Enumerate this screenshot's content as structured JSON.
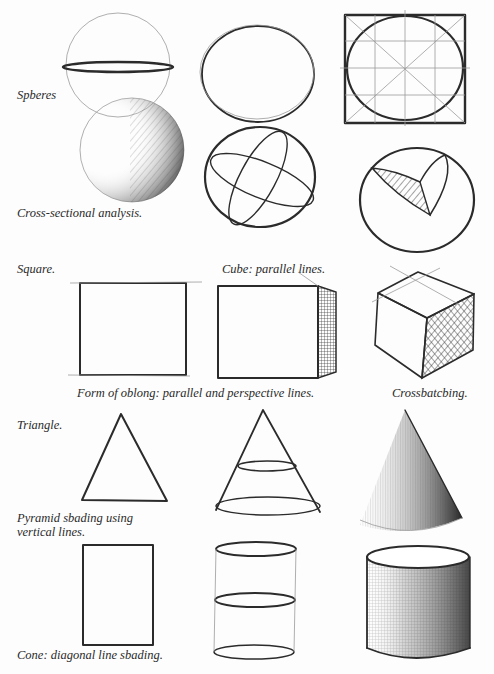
{
  "figure": {
    "ink_color": "#2b2b2b",
    "paper_color": "#fdfdfd"
  },
  "labels": {
    "spheres": "Spberes",
    "cross_section": "Cross-sectional analysis.",
    "square": "Square.",
    "cube": "Cube: parallel lines.",
    "oblong": "Form of oblong: parallel and perspective lines.",
    "crosshatching": "Crossbatcbing.",
    "triangle": "Triangle.",
    "pyramid_line1": "Pyramid sbading using",
    "pyramid_line2": "vertical lines.",
    "cone": "Cone: diagonal line sbading."
  },
  "sketches": [
    {
      "id": "sphere-equator",
      "row": 1,
      "col": 1
    },
    {
      "id": "circle-outline",
      "row": 1,
      "col": 2
    },
    {
      "id": "circle-in-square-grid",
      "row": 1,
      "col": 3
    },
    {
      "id": "sphere-shaded",
      "row": 2,
      "col": 1
    },
    {
      "id": "sphere-cross-sections",
      "row": 2,
      "col": 2
    },
    {
      "id": "sphere-cutaway",
      "row": 2,
      "col": 3
    },
    {
      "id": "square",
      "row": 3,
      "col": 1
    },
    {
      "id": "cube-front-hatched",
      "row": 3,
      "col": 2
    },
    {
      "id": "cube-crosshatched",
      "row": 3,
      "col": 3
    },
    {
      "id": "triangle",
      "row": 4,
      "col": 1
    },
    {
      "id": "cone-ellipses",
      "row": 4,
      "col": 2
    },
    {
      "id": "cone-shaded",
      "row": 4,
      "col": 3
    },
    {
      "id": "rectangle",
      "row": 5,
      "col": 1
    },
    {
      "id": "cylinder-ellipses",
      "row": 5,
      "col": 2
    },
    {
      "id": "cylinder-shaded",
      "row": 5,
      "col": 3
    }
  ]
}
